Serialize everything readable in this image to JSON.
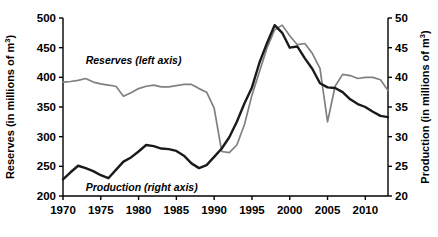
{
  "chart_data": {
    "type": "line",
    "title": "",
    "xlabel": "",
    "xlim": [
      1970,
      2013
    ],
    "x_ticks": [
      "1970",
      "1975",
      "1980",
      "1985",
      "1990",
      "1995",
      "2000",
      "2005",
      "2010"
    ],
    "x_tick_values": [
      1970,
      1975,
      1980,
      1985,
      1990,
      1995,
      2000,
      2005,
      2010
    ],
    "grid": false,
    "legend_position": "inline-annotation",
    "axes": [
      {
        "side": "left",
        "label": "Reserves (in millions of m3)",
        "label_prefix": "Reserves (in millions of m",
        "label_sup": "3",
        "label_suffix": ")",
        "ylim": [
          200,
          500
        ],
        "ticks": [
          "200",
          "250",
          "300",
          "350",
          "400",
          "450",
          "500"
        ],
        "tick_values": [
          200,
          250,
          300,
          350,
          400,
          450,
          500
        ]
      },
      {
        "side": "right",
        "label": "Production (in millions of m3)",
        "label_prefix": "Production (in millions of m",
        "label_sup": "3",
        "label_suffix": ")",
        "ylim": [
          20,
          50
        ],
        "ticks": [
          "20",
          "25",
          "30",
          "35",
          "40",
          "45",
          "50"
        ],
        "tick_values": [
          20,
          25,
          30,
          35,
          40,
          45,
          50
        ]
      }
    ],
    "annotations": [
      {
        "name": "reserves-series-label",
        "text": "Reserves (left axis)",
        "x": 1973.0,
        "y": 423,
        "axis": "left"
      },
      {
        "name": "production-series-label",
        "text": "Production (right axis)",
        "x": 1973.0,
        "y": 209,
        "axis": "left"
      }
    ],
    "series": [
      {
        "name": "Reserves (left axis)",
        "axis": "left",
        "color": "#808080",
        "units": "millions of m3",
        "x": [
          1970,
          1971,
          1972,
          1973,
          1974,
          1975,
          1976,
          1977,
          1978,
          1979,
          1980,
          1981,
          1982,
          1983,
          1984,
          1985,
          1986,
          1987,
          1988,
          1989,
          1990,
          1991,
          1992,
          1993,
          1994,
          1995,
          1996,
          1997,
          1998,
          1999,
          2000,
          2001,
          2002,
          2003,
          2004,
          2005,
          2006,
          2007,
          2008,
          2009,
          2010,
          2011,
          2012,
          2013
        ],
        "values": [
          392,
          393,
          395,
          398,
          392,
          389,
          387,
          385,
          368,
          374,
          381,
          385,
          387,
          384,
          384,
          386,
          388,
          388,
          381,
          375,
          348,
          275,
          273,
          286,
          320,
          370,
          410,
          450,
          480,
          488,
          470,
          455,
          457,
          440,
          415,
          325,
          385,
          405,
          403,
          398,
          400,
          400,
          396,
          378
        ]
      },
      {
        "name": "Production (right axis)",
        "axis": "right",
        "color": "#1a1a1a",
        "units": "millions of m3",
        "x": [
          1970,
          1971,
          1972,
          1973,
          1974,
          1975,
          1976,
          1977,
          1978,
          1979,
          1980,
          1981,
          1982,
          1983,
          1984,
          1985,
          1986,
          1987,
          1988,
          1989,
          1990,
          1991,
          1992,
          1993,
          1994,
          1995,
          1996,
          1997,
          1998,
          1999,
          2000,
          2001,
          2002,
          2003,
          2004,
          2005,
          2006,
          2007,
          2008,
          2009,
          2010,
          2011,
          2012,
          2013
        ],
        "values": [
          22.8,
          24.0,
          25.1,
          24.7,
          24.2,
          23.5,
          23.0,
          24.4,
          25.8,
          26.5,
          27.5,
          28.6,
          28.4,
          28.0,
          27.9,
          27.6,
          26.8,
          25.5,
          24.7,
          25.2,
          26.6,
          28.0,
          29.9,
          32.5,
          35.6,
          38.3,
          42.5,
          45.8,
          48.8,
          47.5,
          45.0,
          45.2,
          43.2,
          41.4,
          39.0,
          38.3,
          38.2,
          37.5,
          36.3,
          35.5,
          35.0,
          34.2,
          33.5,
          33.3
        ]
      }
    ]
  }
}
